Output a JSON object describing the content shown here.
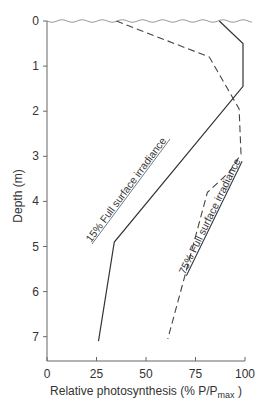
{
  "chart_data": {
    "type": "line",
    "title": "",
    "xlabel": "Relative photosynthesis (% P/P",
    "xlabel_sub": "max",
    "xlabel_end": " )",
    "ylabel": "Depth (m)",
    "xlim": [
      0,
      100
    ],
    "ylim": [
      0,
      7.5
    ],
    "y_inverted": true,
    "grid": false,
    "x_ticks": [
      "0",
      "25",
      "50",
      "75",
      "100"
    ],
    "y_ticks": [
      "0",
      "1",
      "2",
      "3",
      "4",
      "5",
      "6",
      "7"
    ],
    "series": [
      {
        "name": "15% Full surface irradiance",
        "style": "solid",
        "points": [
          {
            "x": 87,
            "depth": 0
          },
          {
            "x": 99,
            "depth": 0.5
          },
          {
            "x": 99,
            "depth": 1.45
          },
          {
            "x": 34,
            "depth": 4.9
          },
          {
            "x": 26,
            "depth": 7.1
          }
        ]
      },
      {
        "name": "75% Full surface irradiance",
        "style": "dashed",
        "points": [
          {
            "x": 35,
            "depth": 0
          },
          {
            "x": 82,
            "depth": 0.8
          },
          {
            "x": 97,
            "depth": 1.95
          },
          {
            "x": 98,
            "depth": 2.95
          },
          {
            "x": 92,
            "depth": 3.35
          },
          {
            "x": 81,
            "depth": 3.8
          },
          {
            "x": 61,
            "depth": 7.05
          }
        ]
      }
    ],
    "annotations": [
      "water surface (wavy line at depth 0)"
    ]
  },
  "labels": {
    "series1": "15% Full surface irradiance",
    "series2": "75% Full surface irradiance",
    "ylabel": "Depth (m)",
    "xlabel_main": "Relative photosynthesis (% P/P",
    "xlabel_sub": "max",
    "xlabel_end": " )"
  }
}
